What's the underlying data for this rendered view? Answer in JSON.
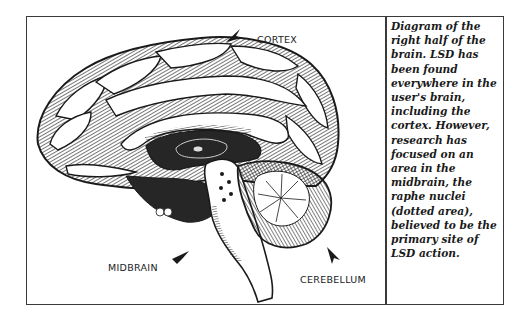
{
  "diagram": {
    "labels": {
      "cortex": "CORTEX",
      "midbrain": "MIDBRAIN",
      "cerebellum": "CEREBELLUM"
    },
    "icons": {
      "cortex_pointer": "arrowhead-pointer-icon",
      "midbrain_pointer": "arrowhead-pointer-icon",
      "cerebellum_pointer": "arrowhead-pointer-icon"
    },
    "colors": {
      "ink": "#1a1a1a",
      "paper": "#ffffff",
      "border": "#3a3a3a"
    }
  },
  "caption": {
    "lines": [
      "Diagram of the",
      "right half of the",
      "brain. LSD has",
      "been found",
      "everywhere in the",
      "user's brain,",
      "including the",
      "cortex. However,",
      "research has",
      "focused on an",
      "area in the",
      "midbrain, the",
      "raphe nuclei",
      "(dotted area),",
      "believed to be the",
      "primary site of",
      "LSD action."
    ]
  }
}
